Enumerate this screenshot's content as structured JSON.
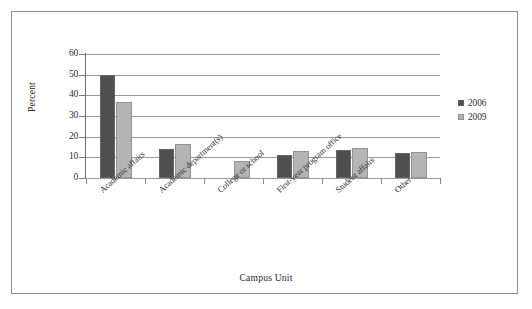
{
  "chart_data": {
    "type": "bar",
    "title": "",
    "xlabel": "Campus Unit",
    "ylabel": "Percent",
    "ylim": [
      0,
      60
    ],
    "yticks": [
      0,
      10,
      20,
      30,
      40,
      50,
      60
    ],
    "ytick_labels": [
      "0",
      "10",
      "20",
      "30",
      "40",
      "50",
      "60"
    ],
    "grid": true,
    "legend_position": "right",
    "categories": [
      "Academic affairs",
      "Academic department(s)",
      "College or school",
      "First-year program office",
      "Student affairs",
      "Other"
    ],
    "series": [
      {
        "name": "2006",
        "color": "#4f4f4f",
        "values": [
          50,
          14,
          0,
          11,
          13.5,
          12
        ]
      },
      {
        "name": "2009",
        "color": "#b4b4b4",
        "values": [
          37,
          16.5,
          8,
          13,
          14.5,
          12.5
        ]
      }
    ]
  },
  "legend": {
    "items": [
      {
        "label": "2006",
        "color": "#4f4f4f"
      },
      {
        "label": "2009",
        "color": "#b4b4b4"
      }
    ]
  },
  "colors": {
    "series_2006": "#4f4f4f",
    "series_2009": "#b4b4b4",
    "gridline": "#9a9a9a",
    "axis": "#6e6e6e",
    "border": "#8d8d8d",
    "background": "#ffffff"
  }
}
